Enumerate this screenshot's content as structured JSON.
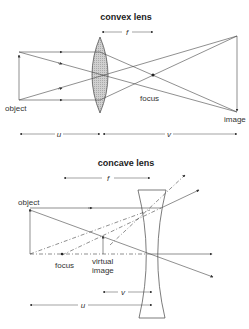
{
  "convex": {
    "title": "convex lens",
    "labels": {
      "f": "f",
      "object": "object",
      "focus": "focus",
      "image": "image",
      "u": "u",
      "v": "v"
    }
  },
  "concave": {
    "title": "concave lens",
    "labels": {
      "f": "f",
      "object": "object",
      "focus": "focus",
      "virtual_image_line1": "virtual",
      "virtual_image_line2": "image",
      "u": "u",
      "v": "v"
    }
  },
  "colors": {
    "line": "#444444",
    "lens_fill": "#c8c8c8",
    "text": "#333333"
  }
}
